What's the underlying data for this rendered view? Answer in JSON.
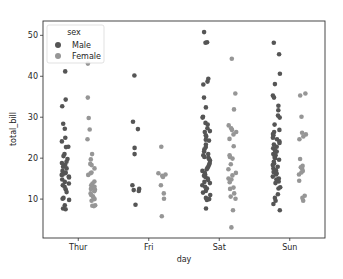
{
  "chart_data": {
    "type": "scatter",
    "subtype": "stripplot",
    "title": "",
    "xlabel": "day",
    "ylabel": "total_bill",
    "categories": [
      "Thur",
      "Fri",
      "Sat",
      "Sun"
    ],
    "ylim": [
      0.5,
      53.5
    ],
    "yticks": [
      10,
      20,
      30,
      40,
      50
    ],
    "grid": false,
    "legend": {
      "title": "sex",
      "position": "upper left",
      "entries": [
        "Male",
        "Female"
      ]
    },
    "series": [
      {
        "name": "Male",
        "color": "#555555",
        "points": {
          "Thur": [
            41.2,
            34.3,
            32.7,
            28.4,
            27.2,
            25.0,
            24.1,
            22.8,
            22.7,
            21.0,
            20.5,
            19.8,
            19.1,
            18.8,
            18.4,
            17.9,
            17.5,
            16.9,
            16.5,
            16.3,
            16.0,
            15.9,
            15.5,
            15.3,
            14.8,
            14.2,
            13.8,
            13.4,
            13.0,
            12.4,
            11.7,
            10.3,
            10.1,
            9.8,
            8.5,
            7.7,
            7.5
          ],
          "Fri": [
            40.2,
            28.9,
            27.1,
            22.5,
            21.0,
            13.4,
            12.5,
            12.2,
            12.0,
            8.6
          ],
          "Sat": [
            50.8,
            48.3,
            48.2,
            39.4,
            38.7,
            38.0,
            34.8,
            32.4,
            30.1,
            29.9,
            28.6,
            28.2,
            27.3,
            26.6,
            26.4,
            25.6,
            25.3,
            24.5,
            24.3,
            23.3,
            22.7,
            22.2,
            21.6,
            21.0,
            20.7,
            20.3,
            20.1,
            19.8,
            19.4,
            18.8,
            18.4,
            17.9,
            17.6,
            17.3,
            16.9,
            16.4,
            16.0,
            15.7,
            15.4,
            15.0,
            14.7,
            14.2,
            13.9,
            13.4,
            13.0,
            12.6,
            12.0,
            11.6,
            11.0,
            10.3,
            10.0,
            9.8,
            7.7
          ],
          "Sun": [
            48.2,
            45.4,
            40.6,
            38.1,
            35.3,
            34.8,
            32.8,
            31.7,
            30.4,
            29.9,
            28.2,
            26.9,
            26.4,
            25.9,
            25.6,
            25.0,
            24.6,
            24.1,
            23.7,
            23.3,
            22.8,
            22.4,
            21.9,
            21.6,
            21.0,
            20.7,
            20.3,
            20.0,
            19.6,
            19.1,
            18.7,
            18.3,
            17.9,
            17.5,
            17.0,
            16.6,
            16.3,
            16.0,
            15.5,
            15.0,
            14.8,
            14.3,
            13.9,
            12.9,
            12.6,
            11.2,
            10.3,
            9.6,
            8.8,
            7.3
          ]
        }
      },
      {
        "name": "Female",
        "color": "#969696",
        "points": {
          "Thur": [
            43.1,
            34.8,
            29.8,
            27.0,
            24.6,
            21.0,
            19.7,
            18.6,
            18.3,
            17.5,
            16.5,
            16.3,
            15.9,
            14.3,
            13.8,
            13.4,
            13.0,
            12.8,
            12.5,
            12.3,
            11.9,
            11.4,
            11.0,
            10.7,
            10.3,
            10.0,
            9.6,
            8.5,
            8.4,
            8.3
          ],
          "Fri": [
            22.8,
            16.3,
            16.0,
            15.7,
            15.4,
            13.4,
            11.4,
            10.1,
            5.8
          ],
          "Sat": [
            44.3,
            35.8,
            31.9,
            28.0,
            27.3,
            26.9,
            26.4,
            25.8,
            24.7,
            22.9,
            20.7,
            20.3,
            19.9,
            18.5,
            17.3,
            16.4,
            15.8,
            15.0,
            14.8,
            14.1,
            12.8,
            12.5,
            11.4,
            10.6,
            10.1,
            7.3,
            3.1
          ],
          "Sun": [
            35.8,
            35.3,
            30.1,
            26.2,
            25.8,
            25.3,
            24.6,
            19.8,
            18.1,
            17.8,
            17.5,
            16.9,
            16.5,
            16.0,
            14.5,
            10.8,
            10.3,
            9.6
          ]
        }
      }
    ]
  },
  "axes": {
    "xlabel": "day",
    "ylabel": "total_bill",
    "xticks": [
      "Thur",
      "Fri",
      "Sat",
      "Sun"
    ],
    "yticks": [
      "10",
      "20",
      "30",
      "40",
      "50"
    ]
  },
  "legend": {
    "title": "sex",
    "items": [
      {
        "label": "Male",
        "color": "#555555"
      },
      {
        "label": "Female",
        "color": "#969696"
      }
    ]
  }
}
